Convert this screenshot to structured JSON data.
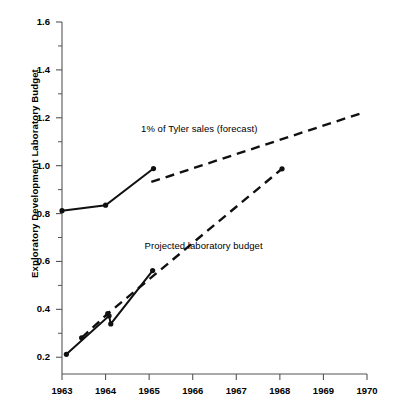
{
  "chart_data": {
    "type": "line",
    "title": "",
    "xlabel": "",
    "ylabel": "Exploratory Development Laboratory Budget",
    "xlim": [
      1963,
      1970
    ],
    "ylim": [
      0.13,
      1.6
    ],
    "grid": false,
    "legend_position": "inline-annotations",
    "xticks": [
      "1963",
      "1964",
      "1965",
      "1966",
      "1967",
      "1968",
      "1969",
      "1970"
    ],
    "yticks": [
      "0.2",
      "0.4",
      "0.6",
      "0.8",
      "1.0",
      "1.2",
      "1.4",
      "1.6"
    ],
    "ytick_values": [
      0.2,
      0.4,
      0.6,
      0.8,
      1.0,
      1.2,
      1.4,
      1.6
    ],
    "yminor_values": [
      0.3,
      0.5,
      0.7,
      0.9,
      1.1,
      1.3,
      1.5
    ],
    "annotations": [
      {
        "text": "1% of Tyler sales (forecast)",
        "x": 1966.15,
        "y": 1.155
      },
      {
        "text": "Projected laboratory budget",
        "x": 1966.25,
        "y": 0.665
      }
    ],
    "series": [
      {
        "name": "1% of Tyler sales (actual)",
        "style": "solid",
        "markers": true,
        "points": [
          {
            "x": 1963.0,
            "y": 0.812
          },
          {
            "x": 1964.0,
            "y": 0.835
          },
          {
            "x": 1965.1,
            "y": 0.988
          }
        ]
      },
      {
        "name": "1% of Tyler sales (forecast)",
        "style": "dashed",
        "markers": false,
        "points": [
          {
            "x": 1965.05,
            "y": 0.932
          },
          {
            "x": 1969.85,
            "y": 1.218
          }
        ]
      },
      {
        "name": "Exploratory development laboratory budget (actual)",
        "style": "solid",
        "markers": true,
        "points": [
          {
            "x": 1963.1,
            "y": 0.212
          },
          {
            "x": 1964.08,
            "y": 0.373
          },
          {
            "x": 1964.12,
            "y": 0.339
          },
          {
            "x": 1965.08,
            "y": 0.562
          }
        ]
      },
      {
        "name": "Projected laboratory budget",
        "style": "dashed",
        "markers": true,
        "points": [
          {
            "x": 1963.45,
            "y": 0.281
          },
          {
            "x": 1964.05,
            "y": 0.382
          },
          {
            "x": 1968.05,
            "y": 0.987
          }
        ]
      }
    ]
  },
  "axis": {
    "y_title": "Exploratory Development Laboratory Budget"
  },
  "colors": {
    "line": "#101010",
    "axis": "#555555",
    "background": "#ffffff"
  }
}
